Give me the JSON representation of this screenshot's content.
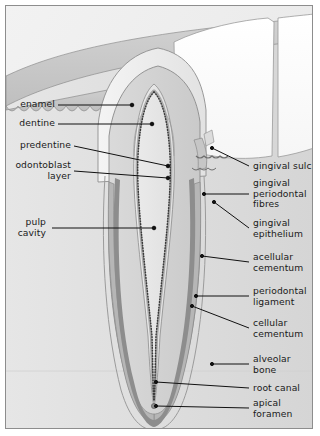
{
  "diagram": {
    "labels_left": [
      {
        "id": "enamel",
        "text": "enamel"
      },
      {
        "id": "dentine",
        "text": "dentine"
      },
      {
        "id": "predentine",
        "text": "predentine"
      },
      {
        "id": "odontoblast-layer",
        "text": "odontoblast\nlayer"
      },
      {
        "id": "pulp-cavity",
        "text": "pulp\ncavity"
      }
    ],
    "labels_right": [
      {
        "id": "gingival-sulcus",
        "text": "gingival sulcus"
      },
      {
        "id": "gingival-periodontal-fibres",
        "text": "gingival\nperiodontal\nfibres"
      },
      {
        "id": "gingival-epithelium",
        "text": "gingival\nepithelium"
      },
      {
        "id": "acellular-cementum",
        "text": "acellular\ncementum"
      },
      {
        "id": "periodontal-ligament",
        "text": "periodontal\nligament"
      },
      {
        "id": "cellular-cementum",
        "text": "cellular\ncementum"
      },
      {
        "id": "alveolar-bone",
        "text": "alveolar\nbone"
      },
      {
        "id": "root-canal",
        "text": "root canal"
      },
      {
        "id": "apical-foramen",
        "text": "apical\nforamen"
      }
    ],
    "colors": {
      "background": "#efefef",
      "frame_border": "#8d8d8d",
      "enamel": "#ededed",
      "dentine": "#d9d9d9",
      "predentine": "#bdbdbd",
      "pulp": "#e6e6e6",
      "gingiva": "#c9c9c9",
      "bone": "#dcdcdc",
      "periodontal_ligament": "#8f8f8f",
      "cementum": "#b4b4b4",
      "adjacent_tooth": "#fdfdfd",
      "leader_line": "#111111",
      "text": "#1a1a1a"
    }
  }
}
